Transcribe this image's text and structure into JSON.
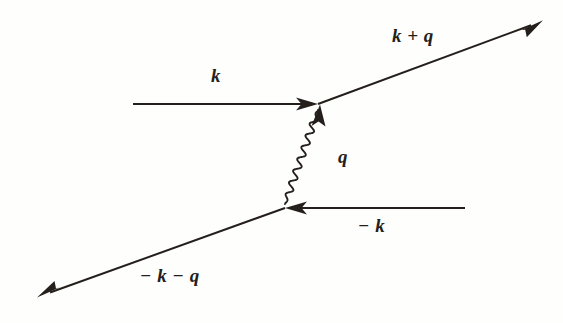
{
  "diagram": {
    "kind": "feynman-diagram",
    "background_color": "#fefefd",
    "ink_color": "#241f1a",
    "stroke_width": 2.0,
    "vertices": {
      "top": {
        "name": "top-vertex",
        "x": 318,
        "y": 104
      },
      "bottom": {
        "name": "bottom-vertex",
        "x": 285,
        "y": 208
      }
    },
    "lines": [
      {
        "name": "incoming-electron-k",
        "style": "straight",
        "label": "k",
        "from": {
          "x": 133,
          "y": 104
        },
        "to": {
          "x": 318,
          "y": 104
        },
        "arrow": "forward",
        "arrow_position": "end"
      },
      {
        "name": "outgoing-electron-k-plus-q",
        "style": "straight",
        "label": "k + q",
        "from": {
          "x": 318,
          "y": 104
        },
        "to": {
          "x": 542,
          "y": 21
        },
        "arrow": "forward",
        "arrow_position": "end"
      },
      {
        "name": "photon-propagator-q",
        "style": "wavy",
        "label": "q",
        "from": {
          "x": 318,
          "y": 110
        },
        "to": {
          "x": 285,
          "y": 204
        },
        "arrow": "none",
        "amplitude": 3.4,
        "wavelength": 12,
        "cycles": 8
      },
      {
        "name": "incoming-electron-minus-k",
        "style": "straight",
        "label": "− k",
        "from": {
          "x": 465,
          "y": 208
        },
        "to": {
          "x": 285,
          "y": 208
        },
        "arrow": "forward",
        "arrow_position": "end"
      },
      {
        "name": "outgoing-electron-minus-k-minus-q",
        "style": "straight",
        "label": "− k − q",
        "from": {
          "x": 285,
          "y": 208
        },
        "to": {
          "x": 38,
          "y": 297
        },
        "arrow": "forward",
        "arrow_position": "end"
      }
    ],
    "labels": {
      "k_plus_q": "k + q",
      "k": "k",
      "q": "q",
      "minus_k": "− k",
      "minus_k_minus_q": "− k − q"
    }
  }
}
